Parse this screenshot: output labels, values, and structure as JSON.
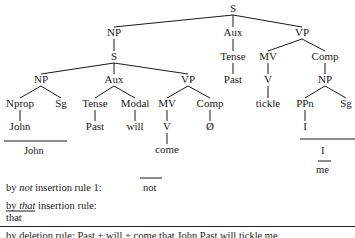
{
  "tree": {
    "nodes": [
      {
        "id": "S0",
        "label": "S",
        "x": 233,
        "y": 12
      },
      {
        "id": "NP1",
        "label": "NP",
        "x": 114,
        "y": 36
      },
      {
        "id": "Aux1",
        "label": "Aux",
        "x": 233,
        "y": 36
      },
      {
        "id": "VP1",
        "label": "VP",
        "x": 302,
        "y": 36
      },
      {
        "id": "S1",
        "label": "S",
        "x": 114,
        "y": 60
      },
      {
        "id": "NP2",
        "label": "NP",
        "x": 41,
        "y": 83
      },
      {
        "id": "Aux2",
        "label": "Aux",
        "x": 114,
        "y": 83
      },
      {
        "id": "VP2",
        "label": "VP",
        "x": 188,
        "y": 83
      },
      {
        "id": "Nprop",
        "label": "Nprop",
        "x": 20,
        "y": 107
      },
      {
        "id": "Sg1",
        "label": "Sg",
        "x": 61,
        "y": 107
      },
      {
        "id": "Tense2",
        "label": "Tense",
        "x": 95,
        "y": 107
      },
      {
        "id": "Modal",
        "label": "Modal",
        "x": 135,
        "y": 107
      },
      {
        "id": "MV2",
        "label": "MV",
        "x": 167,
        "y": 107
      },
      {
        "id": "Comp2",
        "label": "Comp",
        "x": 210,
        "y": 107
      },
      {
        "id": "John",
        "label": "John",
        "x": 20,
        "y": 130
      },
      {
        "id": "Past2",
        "label": "Past",
        "x": 95,
        "y": 130
      },
      {
        "id": "will",
        "label": "will",
        "x": 135,
        "y": 130
      },
      {
        "id": "V2",
        "label": "V",
        "x": 167,
        "y": 130
      },
      {
        "id": "null",
        "label": "Ø",
        "x": 210,
        "y": 130
      },
      {
        "id": "come",
        "label": "come",
        "x": 167,
        "y": 153
      },
      {
        "id": "Tense1",
        "label": "Tense",
        "x": 233,
        "y": 60
      },
      {
        "id": "Past1",
        "label": "Past",
        "x": 233,
        "y": 83
      },
      {
        "id": "MV1",
        "label": "MV",
        "x": 268,
        "y": 60
      },
      {
        "id": "V1",
        "label": "V",
        "x": 268,
        "y": 83
      },
      {
        "id": "tickle",
        "label": "tickle",
        "x": 268,
        "y": 107
      },
      {
        "id": "Comp1",
        "label": "Comp",
        "x": 325,
        "y": 60
      },
      {
        "id": "NP3",
        "label": "NP",
        "x": 325,
        "y": 83
      },
      {
        "id": "PPn",
        "label": "PPn",
        "x": 305,
        "y": 107
      },
      {
        "id": "Sg3",
        "label": "Sg",
        "x": 346,
        "y": 107
      },
      {
        "id": "I",
        "label": "I",
        "x": 305,
        "y": 130
      }
    ],
    "edges": [
      [
        "S0",
        "NP1"
      ],
      [
        "S0",
        "Aux1"
      ],
      [
        "S0",
        "VP1"
      ],
      [
        "NP1",
        "S1"
      ],
      [
        "S1",
        "NP2"
      ],
      [
        "S1",
        "Aux2"
      ],
      [
        "S1",
        "VP2"
      ],
      [
        "NP2",
        "Nprop"
      ],
      [
        "NP2",
        "Sg1"
      ],
      [
        "Aux2",
        "Tense2"
      ],
      [
        "Aux2",
        "Modal"
      ],
      [
        "VP2",
        "MV2"
      ],
      [
        "VP2",
        "Comp2"
      ],
      [
        "Nprop",
        "John"
      ],
      [
        "Tense2",
        "Past2"
      ],
      [
        "Modal",
        "will"
      ],
      [
        "MV2",
        "V2"
      ],
      [
        "Comp2",
        "null"
      ],
      [
        "V2",
        "come"
      ],
      [
        "Aux1",
        "Tense1"
      ],
      [
        "Tense1",
        "Past1"
      ],
      [
        "VP1",
        "MV1"
      ],
      [
        "VP1",
        "Comp1"
      ],
      [
        "MV1",
        "V1"
      ],
      [
        "V1",
        "tickle"
      ],
      [
        "Comp1",
        "NP3"
      ],
      [
        "NP3",
        "PPn"
      ],
      [
        "NP3",
        "Sg3"
      ],
      [
        "PPn",
        "I"
      ]
    ]
  },
  "derivations": {
    "john_result": "John",
    "i_result_top": "I",
    "i_result_bottom": "me",
    "not_rule_prefix": "by ",
    "not_rule_italic": "not",
    "not_rule_suffix": " insertion rule 1:",
    "not_result": "not",
    "that_rule_prefix": "by ",
    "that_rule_italic": "that",
    "that_rule_suffix": " insertion rule:",
    "that_result": "that",
    "bottom_line": "by deletion rule:  Past + will + come  that John Past will tickle me"
  }
}
